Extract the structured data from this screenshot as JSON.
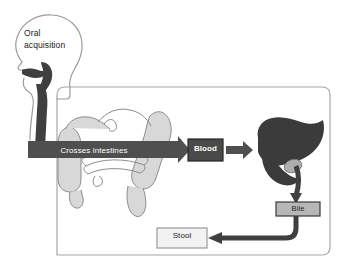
{
  "diagram": {
    "annotations": {
      "oral_line1": "Oral",
      "oral_line2": "acquisition"
    },
    "flow_labels": {
      "crosses_intestines": "Crosses intestines"
    },
    "nodes": [
      {
        "id": "blood",
        "label": "Blood",
        "fill": "#4a4a4a",
        "text_color": "#ffffff",
        "border": "#2b2b2b"
      },
      {
        "id": "bile",
        "label": "Bile",
        "fill": "#b7b7b7",
        "text_color": "#1f1f1f",
        "border": "#3a3a3a"
      },
      {
        "id": "stool",
        "label": "Stool",
        "fill": "#f2f2f2",
        "text_color": "#1f1f1f",
        "border": "#9a9a9a"
      }
    ],
    "anatomy": [
      {
        "id": "head",
        "label": "head-profile-outline"
      },
      {
        "id": "esophagus",
        "label": "esophagus-dark-path"
      },
      {
        "id": "intestines",
        "label": "intestines-illustration"
      },
      {
        "id": "liver",
        "label": "liver-silhouette"
      },
      {
        "id": "gallbladder",
        "label": "gallbladder"
      },
      {
        "id": "bile-duct",
        "label": "bile-duct"
      }
    ],
    "colors": {
      "dark_arrow": "#4f4f4f",
      "darkest": "#3a3a3a",
      "liver": "#3b3b3b",
      "outline": "#9b9b9b",
      "organ_fill": "#d6d6d6",
      "organ_line": "#8c8c8c",
      "frame": "#a6a6a6",
      "background": "#ffffff"
    }
  }
}
